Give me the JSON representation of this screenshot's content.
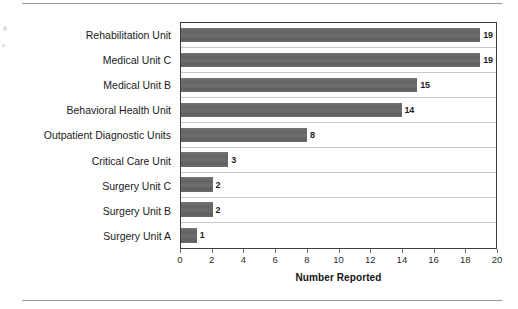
{
  "chart_data": {
    "type": "bar",
    "orientation": "horizontal",
    "title": "",
    "xlabel": "Number Reported",
    "ylabel": "",
    "xlim": [
      0,
      20
    ],
    "xticks": [
      0,
      2,
      4,
      6,
      8,
      10,
      12,
      14,
      16,
      18,
      20
    ],
    "grid": true,
    "grid_axis": "y",
    "legend": false,
    "bar_color": "#6b6b6b",
    "categories": [
      "Rehabilitation Unit",
      "Medical Unit C",
      "Medical Unit B",
      "Behavioral Health Unit",
      "Outpatient Diagnostic Units",
      "Critical Care Unit",
      "Surgery Unit C",
      "Surgery Unit B",
      "Surgery Unit A"
    ],
    "values": [
      19,
      19,
      15,
      14,
      8,
      3,
      2,
      2,
      1
    ],
    "data_labels": [
      "19",
      "19",
      "15",
      "14",
      "8",
      "3",
      "2",
      "2",
      "1"
    ],
    "tick_labels": [
      "0",
      "2",
      "4",
      "6",
      "8",
      "10",
      "12",
      "14",
      "16",
      "18",
      "20"
    ]
  }
}
